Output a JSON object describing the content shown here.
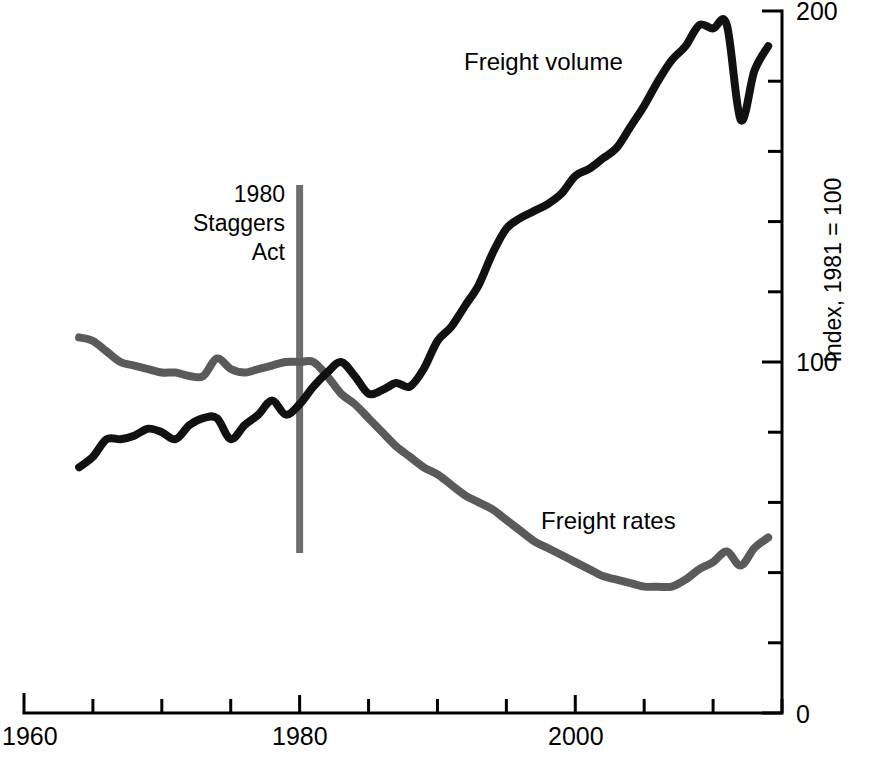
{
  "chart_data": {
    "type": "line",
    "title": "",
    "subtitle": "",
    "xlabel": "",
    "ylabel": "Index, 1981 = 100",
    "xlim": [
      1960,
      2015
    ],
    "ylim": [
      0,
      200
    ],
    "grid": false,
    "legend": "inline-labels",
    "x_ticks": [
      1960,
      1965,
      1970,
      1975,
      1980,
      1985,
      1990,
      1995,
      2000,
      2005,
      2010,
      2015
    ],
    "x_tick_labels": [
      "1960",
      "",
      "",
      "",
      "1980",
      "",
      "",
      "",
      "2000",
      "",
      "",
      ""
    ],
    "y_ticks": [
      0,
      20,
      40,
      60,
      80,
      100,
      120,
      140,
      160,
      180,
      200
    ],
    "y_tick_labels": [
      "0",
      "",
      "",
      "",
      "",
      "100",
      "",
      "",
      "",
      "",
      "200"
    ],
    "annotations": [
      {
        "name": "staggers-act-marker",
        "x": 1980,
        "lines": [
          "1980",
          "Staggers",
          "Act"
        ],
        "color": "#6e6e6e",
        "style": "vertical-rule"
      }
    ],
    "series": [
      {
        "name": "Freight volume",
        "color": "#111111",
        "label_x": 1995,
        "label_y": 181,
        "x": [
          1964,
          1965,
          1966,
          1967,
          1968,
          1969,
          1970,
          1971,
          1972,
          1973,
          1974,
          1975,
          1976,
          1977,
          1978,
          1979,
          1980,
          1981,
          1982,
          1983,
          1984,
          1985,
          1986,
          1987,
          1988,
          1989,
          1990,
          1991,
          1992,
          1993,
          1994,
          1995,
          1996,
          1997,
          1998,
          1999,
          2000,
          2001,
          2002,
          2003,
          2004,
          2005,
          2006,
          2007,
          2008,
          2009,
          2010,
          2011,
          2012,
          2013,
          2014
        ],
        "values": [
          70,
          73,
          78,
          78,
          79,
          81,
          80,
          78,
          82,
          84,
          84,
          78,
          82,
          85,
          89,
          85,
          88,
          93,
          97,
          100,
          96,
          91,
          92,
          94,
          93,
          98,
          106,
          110,
          116,
          122,
          131,
          138,
          141,
          143,
          145,
          148,
          153,
          155,
          158,
          161,
          167,
          173,
          180,
          186,
          190,
          196,
          195,
          196,
          169,
          183,
          190
        ]
      },
      {
        "name": "Freight rates",
        "color": "#5a5a5a",
        "label_x": 1999,
        "label_y": 48,
        "x": [
          1964,
          1965,
          1966,
          1967,
          1968,
          1969,
          1970,
          1971,
          1972,
          1973,
          1974,
          1975,
          1976,
          1977,
          1978,
          1979,
          1980,
          1981,
          1982,
          1983,
          1984,
          1985,
          1986,
          1987,
          1988,
          1989,
          1990,
          1991,
          1992,
          1993,
          1994,
          1995,
          1996,
          1997,
          1998,
          1999,
          2000,
          2001,
          2002,
          2003,
          2004,
          2005,
          2006,
          2007,
          2008,
          2009,
          2010,
          2011,
          2012,
          2013,
          2014
        ],
        "values": [
          107,
          106,
          103,
          100,
          99,
          98,
          97,
          97,
          96,
          96,
          101,
          98,
          97,
          98,
          99,
          100,
          100,
          100,
          96,
          91,
          88,
          84,
          80,
          76,
          73,
          70,
          68,
          65,
          62,
          60,
          58,
          55,
          52,
          49,
          47,
          45,
          43,
          41,
          39,
          38,
          37,
          36,
          36,
          36,
          38,
          41,
          43,
          46,
          42,
          47,
          50
        ]
      }
    ]
  },
  "labels": {
    "y_axis_title": "Index, 1981 = 100",
    "x_1960": "1960",
    "x_1980": "1980",
    "x_2000": "2000",
    "y_0": "0",
    "y_100": "100",
    "y_200": "200",
    "series_volume": "Freight volume",
    "series_rates": "Freight rates",
    "annot_line1": "1980",
    "annot_line2": "Staggers",
    "annot_line3": "Act"
  },
  "colors": {
    "volume": "#111111",
    "rates": "#5a5a5a",
    "annotation": "#6e6e6e",
    "axis": "#000000",
    "background": "#ffffff"
  }
}
